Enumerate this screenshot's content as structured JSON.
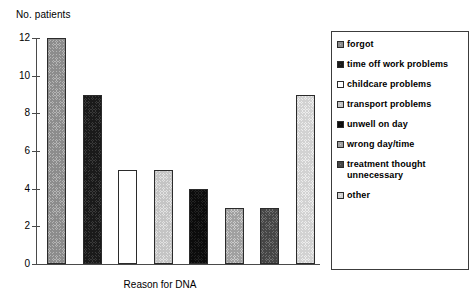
{
  "chart_data": {
    "type": "bar",
    "title": "",
    "xlabel": "Reason for DNA",
    "ylabel": "No. patients",
    "ylim": [
      0,
      12
    ],
    "ytick_labels": [
      "12",
      "10",
      "8",
      "6",
      "4",
      "2",
      "0"
    ],
    "ytick_values": [
      12,
      10,
      8,
      6,
      4,
      2,
      0
    ],
    "grid": false,
    "legend_position": "right",
    "categories": [
      "forgot",
      "time off work problems",
      "childcare problems",
      "transport problems",
      "unwell on day",
      "wrong day/time",
      "treatment thought unnecessary",
      "other"
    ],
    "values": [
      12,
      9,
      5,
      5,
      4,
      3,
      3,
      9
    ],
    "series": [
      {
        "name": "No. patients",
        "values": [
          12,
          9,
          5,
          5,
          4,
          3,
          3,
          9
        ]
      }
    ]
  },
  "axes": {
    "y_title": "No. patients",
    "x_title": "Reason for DNA",
    "ticks": [
      {
        "label": "12",
        "value": 12
      },
      {
        "label": "10",
        "value": 10
      },
      {
        "label": "8",
        "value": 8
      },
      {
        "label": "6",
        "value": 6
      },
      {
        "label": "4",
        "value": 4
      },
      {
        "label": "2",
        "value": 2
      },
      {
        "label": "0",
        "value": 0
      }
    ]
  },
  "bars": [
    {
      "label": "forgot",
      "value": 12,
      "pattern": "pat-mid"
    },
    {
      "label": "time off work problems",
      "value": 9,
      "pattern": "pat-dark"
    },
    {
      "label": "childcare problems",
      "value": 5,
      "pattern": "pat-white"
    },
    {
      "label": "transport problems",
      "value": 5,
      "pattern": "pat-light"
    },
    {
      "label": "unwell on day",
      "value": 4,
      "pattern": "pat-solid-dark"
    },
    {
      "label": "wrong day/time",
      "value": 3,
      "pattern": "pat-midlight"
    },
    {
      "label": "treatment thought unnecessary",
      "value": 3,
      "pattern": "pat-middark"
    },
    {
      "label": "other",
      "value": 9,
      "pattern": "pat-vlight"
    }
  ],
  "legend": {
    "items": [
      {
        "label": "forgot",
        "pattern": "pat-mid"
      },
      {
        "label": "time off work problems",
        "pattern": "pat-dark"
      },
      {
        "label": "childcare problems",
        "pattern": "pat-white"
      },
      {
        "label": "transport problems",
        "pattern": "pat-light"
      },
      {
        "label": "unwell on day",
        "pattern": "pat-solid-dark"
      },
      {
        "label": "wrong day/time",
        "pattern": "pat-midlight"
      },
      {
        "label": "treatment thought\nunnecessary",
        "pattern": "pat-middark"
      },
      {
        "label": "other",
        "pattern": "pat-vlight"
      }
    ]
  },
  "colors": {
    "axis": "#4a4a4a",
    "bar_outline": "#2b2b2b",
    "legend_border": "#3c3c3c",
    "background": "#ffffff",
    "text": "#000000"
  }
}
